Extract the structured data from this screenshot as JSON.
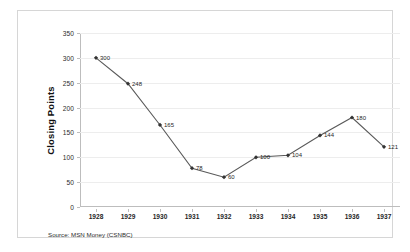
{
  "chart_data": {
    "type": "line",
    "title": "",
    "subtitle": "",
    "xlabel": "",
    "ylabel": "Closing Points",
    "categories": [
      "1928",
      "1929",
      "1930",
      "1931",
      "1932",
      "1933",
      "1934",
      "1935",
      "1936",
      "1937"
    ],
    "values": [
      300,
      248,
      165,
      78,
      60,
      100,
      104,
      144,
      180,
      121
    ],
    "point_labels": [
      "300",
      "248",
      "165",
      "78",
      "60",
      "100",
      "104",
      "144",
      "180",
      "121"
    ],
    "series": [
      {
        "name": "Closing Points",
        "values": [
          300,
          248,
          165,
          78,
          60,
          100,
          104,
          144,
          180,
          121
        ]
      }
    ],
    "ylim": [
      0,
      350
    ],
    "yticks": [
      0,
      50,
      100,
      150,
      200,
      250,
      300,
      350
    ],
    "ytick_labels": [
      "0",
      "50",
      "100",
      "150",
      "200",
      "250",
      "300",
      "350"
    ],
    "grid": true,
    "grid_axis": "y",
    "legend": false,
    "legend_position": "none",
    "marker": "diamond",
    "data_labels": true,
    "annotations": [
      "Source: MSN Money (CSNBC)"
    ],
    "colors": {
      "line": "#595959",
      "marker": "#333333",
      "grid": "#ededed",
      "axis": "#bdbdbd",
      "text": "#1f1f1f",
      "background": "#ffffff",
      "border": "#d6d6d6"
    }
  },
  "footer": {
    "source_text": "Source: MSN Money (CSNBC)"
  }
}
